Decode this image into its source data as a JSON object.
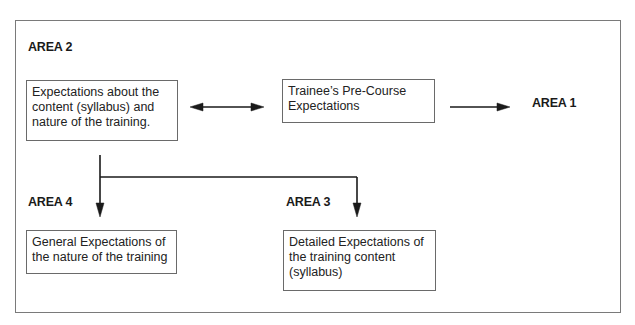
{
  "diagram": {
    "areas": {
      "area1": {
        "label": "AREA 1"
      },
      "area2": {
        "label": "AREA 2",
        "box_text": "Expectations about the content (syllabus) and nature of the training."
      },
      "area3": {
        "label": "AREA 3",
        "box_text": "Detailed Expectations of the training content (syllabus)"
      },
      "area4": {
        "label": "AREA 4",
        "box_text": "General Expectations of the nature of the training"
      }
    },
    "center_box": {
      "text": "Trainee’s Pre-Course Expectations"
    },
    "box_lines": {
      "area2": [
        "Expectations about the",
        "content (syllabus) and",
        "nature of the training."
      ],
      "center": [
        "Trainee’s Pre-Course",
        "Expectations"
      ],
      "area4": [
        "General Expectations of",
        "the nature of the training"
      ],
      "area3": [
        "Detailed Expectations of",
        "the training content",
        "(syllabus)"
      ]
    },
    "edges": [
      {
        "from": "area2",
        "to": "center_box",
        "type": "bidirectional"
      },
      {
        "from": "center_box",
        "to": "area1",
        "type": "arrow"
      },
      {
        "from": "area2",
        "to": "area4",
        "type": "arrow"
      },
      {
        "from": "area2",
        "to": "area3",
        "type": "arrow"
      }
    ],
    "colors": {
      "line": "#1a1a1a",
      "frame": "#7a7a7a",
      "box_border": "#6a6a6a"
    }
  }
}
